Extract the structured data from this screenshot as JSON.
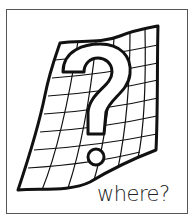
{
  "illustration": {
    "subject": "wavy map grid with question mark",
    "icon": "question-mark-map-icon",
    "caption": "where?",
    "colors": {
      "line": "#111111",
      "frame": "#555555",
      "background": "#ffffff"
    }
  }
}
